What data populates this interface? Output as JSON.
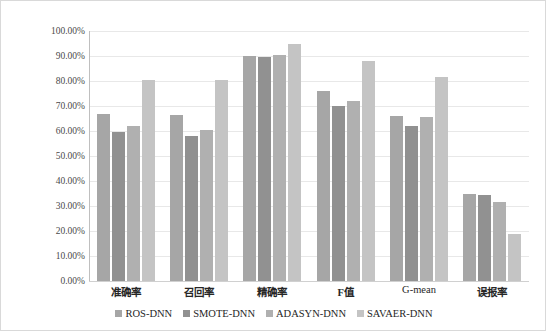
{
  "chart_data": {
    "type": "bar",
    "title": "",
    "xlabel": "",
    "ylabel": "",
    "ylim": [
      0,
      100
    ],
    "grid": true,
    "legend_position": "bottom-center",
    "y_tick_labels": [
      "100.00%",
      "90.00%",
      "80.00%",
      "70.00%",
      "60.00%",
      "50.00%",
      "40.00%",
      "30.00%",
      "20.00%",
      "10.00%",
      "0.00%"
    ],
    "y_tick_values": [
      100,
      90,
      80,
      70,
      60,
      50,
      40,
      30,
      20,
      10,
      0
    ],
    "categories": [
      "准确率",
      "召回率",
      "精确率",
      "F值",
      "G-mean",
      "误报率"
    ],
    "series": [
      {
        "name": "ROS-DNN",
        "color": "#a6a6a6",
        "values": [
          67.0,
          66.5,
          90.0,
          76.0,
          66.0,
          35.0
        ]
      },
      {
        "name": "SMOTE-DNN",
        "color": "#919191",
        "values": [
          59.5,
          58.0,
          89.5,
          70.0,
          62.0,
          34.5
        ]
      },
      {
        "name": "ADASYN-DNN",
        "color": "#b0b0b0",
        "values": [
          62.0,
          60.5,
          90.5,
          72.0,
          65.5,
          31.5
        ]
      },
      {
        "name": "SAVAER-DNN",
        "color": "#c4c4c4",
        "values": [
          80.5,
          80.5,
          95.0,
          88.0,
          81.5,
          19.0
        ]
      }
    ]
  },
  "style": {
    "gridline_color": "#e8e8e8",
    "axis_color": "#bfbfbf",
    "frame_color": "#d9d9d9",
    "text_color": "#262626",
    "tick_text_color": "#4a4a4a"
  }
}
